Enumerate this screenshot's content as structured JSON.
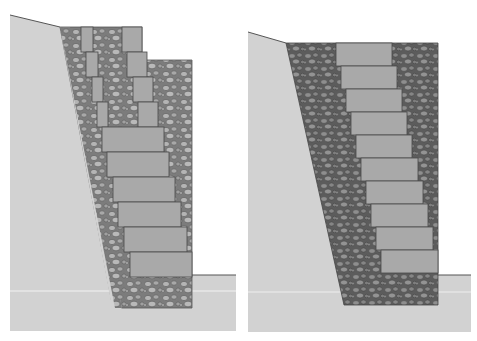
{
  "diagram": {
    "type": "retaining-wall-cross-sections",
    "colors": {
      "background": "#ffffff",
      "soil": "#d2d2d2",
      "soil_light_band": "#dadada",
      "block": "#a9a9a9",
      "block_stroke": "#4a4a4a",
      "gravel_light": "#9a9a9a",
      "gravel_dark": "#6e6e6e",
      "stone_light": "#b8b8b8",
      "stone_dark": "#8a8a8a",
      "outline": "#555555"
    },
    "panels": [
      {
        "name": "left-section",
        "description": "Segmental block wall with drainage gravel between block tails and partial-depth blocks at top",
        "block_count": 11
      },
      {
        "name": "right-section",
        "description": "Segmental block wall with dark drainage gravel fill behind stepped blocks",
        "block_count": 10
      }
    ]
  }
}
